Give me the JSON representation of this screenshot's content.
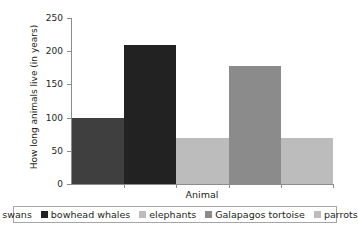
{
  "chart_data": {
    "type": "bar",
    "title": "",
    "xlabel": "Animal",
    "ylabel": "How long animals live (in years)",
    "categories": [
      "swans",
      "bowhead whales",
      "elephants",
      "Galapagos tortoise",
      "parrots"
    ],
    "values": [
      100,
      210,
      70,
      177,
      70
    ],
    "ylim": [
      0,
      250
    ],
    "yticks": [
      0,
      50,
      100,
      150,
      200,
      250
    ],
    "ytick_labels": [
      "0",
      "50",
      "100",
      "150",
      "200",
      "250"
    ],
    "grid": false,
    "legend_position": "bottom",
    "bar_colors": [
      "#3f3f3f",
      "#222222",
      "#bcbcbc",
      "#8b8b8b",
      "#bcbcbc"
    ],
    "series": [
      {
        "name": "How long animals live (in years)",
        "values": [
          100,
          210,
          70,
          177,
          70
        ]
      }
    ],
    "points": [
      {
        "category": "swans",
        "value": 100,
        "color": "#3f3f3f"
      },
      {
        "category": "bowhead whales",
        "value": 210,
        "color": "#222222"
      },
      {
        "category": "elephants",
        "value": 70,
        "color": "#bcbcbc"
      },
      {
        "category": "Galapagos tortoise",
        "value": 177,
        "color": "#8b8b8b"
      },
      {
        "category": "parrots",
        "value": 70,
        "color": "#bcbcbc"
      }
    ]
  },
  "legend": {
    "items": [
      {
        "label": "swans",
        "color": "#3f3f3f"
      },
      {
        "label": "bowhead whales",
        "color": "#222222"
      },
      {
        "label": "elephants",
        "color": "#bcbcbc"
      },
      {
        "label": "Galapagos tortoise",
        "color": "#8b8b8b"
      },
      {
        "label": "parrots",
        "color": "#bcbcbc"
      }
    ]
  },
  "colors": {
    "axis": "#8c8c8c",
    "text": "#231f20",
    "background": "#ffffff",
    "legend_border": "#a6a6a6"
  }
}
